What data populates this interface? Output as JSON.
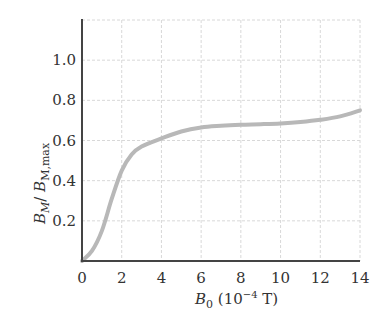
{
  "chart_data": {
    "type": "line",
    "title": "",
    "xlabel": "B0 (10^-4 T)",
    "xlabel_parts": {
      "main": "B",
      "sub": "0",
      "rest": " (10",
      "sup": "−4",
      "unit": " T)"
    },
    "ylabel": "B_M / B_M,max",
    "ylabel_parts": {
      "b1": "B",
      "sub1": "M",
      "slash": "/ ",
      "b2": "B",
      "sub2": "M,max"
    },
    "xlim": [
      0,
      14
    ],
    "ylim": [
      0,
      1.2
    ],
    "grid": true,
    "x_ticks": [
      0,
      2,
      4,
      6,
      8,
      10,
      12,
      14
    ],
    "x_tick_labels": [
      "0",
      "2",
      "4",
      "6",
      "8",
      "10",
      "12",
      "14"
    ],
    "y_ticks": [
      0.2,
      0.4,
      0.6,
      0.8,
      1.0
    ],
    "y_tick_labels": [
      "0.2",
      "0.4",
      "0.6",
      "0.8",
      "1.0"
    ],
    "series": [
      {
        "name": "B_M / B_M,max",
        "color": "#b8b8b8",
        "x": [
          0,
          0.5,
          1.0,
          1.5,
          2.0,
          2.5,
          3.0,
          4.0,
          5.0,
          6.0,
          7.0,
          8.0,
          9.0,
          10.0,
          11.0,
          12.0,
          13.0,
          14.0
        ],
        "values": [
          0.0,
          0.05,
          0.15,
          0.31,
          0.45,
          0.53,
          0.57,
          0.61,
          0.645,
          0.665,
          0.673,
          0.678,
          0.681,
          0.685,
          0.692,
          0.703,
          0.72,
          0.75
        ]
      }
    ]
  }
}
